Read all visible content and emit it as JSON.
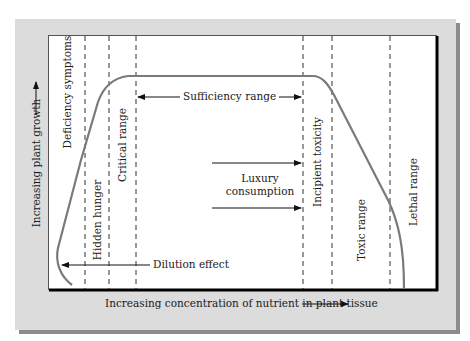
{
  "diagram": {
    "axes": {
      "x_label": "Increasing concentration of nutrient in plant tissue",
      "y_label": "Increasing plant growth"
    },
    "zones": [
      {
        "label": "Deficiency symptoms"
      },
      {
        "label": "Hidden hunger"
      },
      {
        "label": "Critical range"
      },
      {
        "label": "Incipient toxicity"
      },
      {
        "label": "Toxic range"
      },
      {
        "label": "Lethal range"
      }
    ],
    "annotations": {
      "sufficiency_range": "Sufficiency range",
      "luxury_line1": "Luxury",
      "luxury_line2": "consumption",
      "dilution_effect": "Dilution effect"
    },
    "colors": {
      "panel": "#dcdcdc",
      "shadow": "#8c8c8c",
      "curve": "#7a7a7a",
      "axis": "#000000"
    }
  }
}
